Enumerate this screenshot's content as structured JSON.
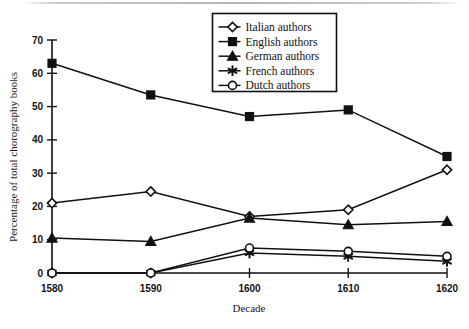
{
  "chart_data": {
    "type": "line",
    "title": "",
    "xlabel": "Decade",
    "ylabel": "Percentage of total chorography books",
    "categories": [
      "1580",
      "1590",
      "1600",
      "1610",
      "1620"
    ],
    "x": [
      1580,
      1590,
      1600,
      1610,
      1620
    ],
    "xlim": [
      1580,
      1620
    ],
    "ylim": [
      0,
      70
    ],
    "yticks": [
      0,
      10,
      20,
      30,
      40,
      50,
      60,
      70
    ],
    "ytick_labels": [
      "0",
      "10",
      "20",
      "30",
      "40",
      "50",
      "60",
      "70"
    ],
    "xtick_labels": [
      "1580",
      "1590",
      "1600",
      "1610",
      "1620"
    ],
    "grid": false,
    "legend_position": "top-center",
    "series": [
      {
        "name": "Italian authors",
        "marker": "open-diamond",
        "values": [
          21,
          24.5,
          17,
          19,
          31
        ]
      },
      {
        "name": "English authors",
        "marker": "filled-square",
        "values": [
          63,
          53.5,
          47,
          49,
          35
        ]
      },
      {
        "name": "German authors",
        "marker": "filled-triangle",
        "values": [
          10.5,
          9.5,
          16.5,
          14.5,
          15.5
        ]
      },
      {
        "name": "French authors",
        "marker": "star-asterisk",
        "values": [
          0,
          0,
          6,
          5,
          3.5
        ]
      },
      {
        "name": "Dutch authors",
        "marker": "open-circle",
        "values": [
          0,
          0,
          7.5,
          6.5,
          5
        ]
      }
    ]
  },
  "legend": {
    "items": [
      {
        "label": "Italian authors",
        "marker": "open-diamond"
      },
      {
        "label": "English authors",
        "marker": "filled-square"
      },
      {
        "label": "German authors",
        "marker": "filled-triangle"
      },
      {
        "label": "French authors",
        "marker": "star-asterisk"
      },
      {
        "label": "Dutch authors",
        "marker": "open-circle"
      }
    ]
  },
  "colors": {
    "ink": "#111111",
    "paper": "#ffffff",
    "scan_rule": "#b4b4b4"
  }
}
